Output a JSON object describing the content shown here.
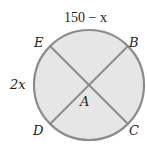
{
  "diagram": {
    "type": "circle-with-intersecting-chords",
    "colors": {
      "fill": "#e6e6e6",
      "stroke": "#8c8c8c",
      "text": "#231f20"
    },
    "center_label": "A",
    "points": [
      {
        "label": "E",
        "position": "upper-left"
      },
      {
        "label": "B",
        "position": "upper-right"
      },
      {
        "label": "D",
        "position": "lower-left"
      },
      {
        "label": "C",
        "position": "lower-right"
      }
    ],
    "chords": [
      "EC",
      "BD"
    ],
    "arc_labels": {
      "top_arc_EB": "150 − x",
      "left_arc_ED": "2x"
    }
  }
}
